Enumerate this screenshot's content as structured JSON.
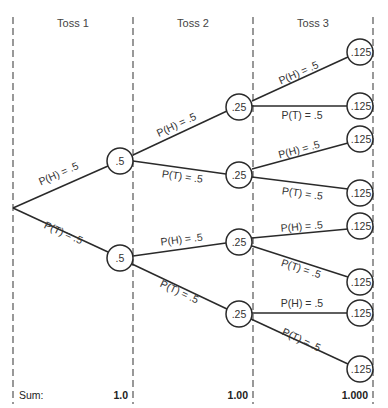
{
  "headers": [
    "Toss 1",
    "Toss 2",
    "Toss 3"
  ],
  "sum_label": "Sum:",
  "sums": [
    "1.0",
    "1.00",
    "1.000"
  ],
  "root": {
    "x": 13,
    "y": 208
  },
  "toss1_nodes": [
    {
      "x": 120,
      "y": 161,
      "label": ".5",
      "edge_label": "P(H) = .5"
    },
    {
      "x": 120,
      "y": 258,
      "label": ".5",
      "edge_label": "P(T) = .5"
    }
  ],
  "toss2_nodes": [
    {
      "x": 239,
      "y": 107,
      "label": ".25",
      "edge_label": "P(H) = .5"
    },
    {
      "x": 239,
      "y": 175,
      "label": ".25",
      "edge_label": "P(T) = .5"
    },
    {
      "x": 239,
      "y": 242,
      "label": ".25",
      "edge_label": "P(H) = .5"
    },
    {
      "x": 239,
      "y": 314,
      "label": ".25",
      "edge_label": "P(T) = .5"
    }
  ],
  "toss3_nodes": [
    {
      "x": 360,
      "y": 52,
      "label": ".125",
      "edge_label": "P(H) = .5"
    },
    {
      "x": 360,
      "y": 106,
      "label": ".125",
      "edge_label": "P(T) = .5"
    },
    {
      "x": 360,
      "y": 139,
      "label": ".125",
      "edge_label": "P(H) = .5"
    },
    {
      "x": 360,
      "y": 193,
      "label": ".125",
      "edge_label": "P(T) = .5"
    },
    {
      "x": 360,
      "y": 226,
      "label": ".125",
      "edge_label": "P(H) = .5"
    },
    {
      "x": 360,
      "y": 282,
      "label": ".125",
      "edge_label": "P(T) = .5"
    },
    {
      "x": 360,
      "y": 313,
      "label": ".125",
      "edge_label": "P(H) = .5"
    },
    {
      "x": 360,
      "y": 369,
      "label": ".125",
      "edge_label": "P(T) = .5"
    }
  ]
}
